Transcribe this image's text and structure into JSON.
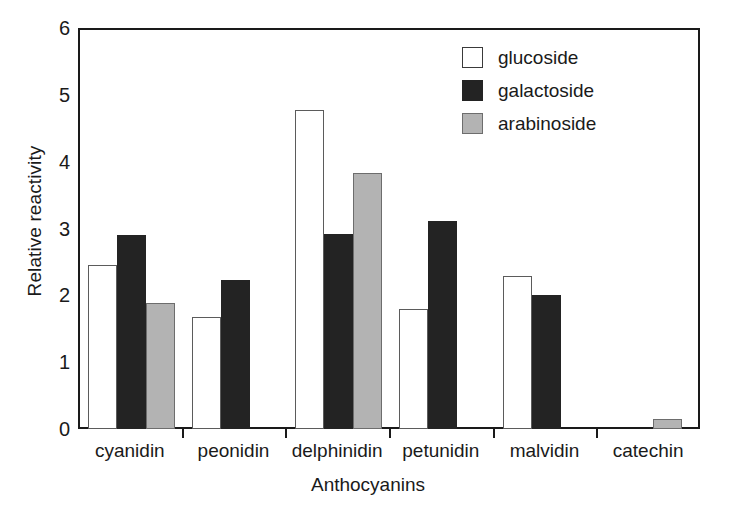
{
  "chart_data": {
    "type": "bar",
    "title": "",
    "xlabel": "Anthocyanins",
    "ylabel": "Relative reactivity",
    "ylim": [
      0,
      6
    ],
    "ytick_labels": [
      "0",
      "1",
      "2",
      "3",
      "4",
      "5",
      "6"
    ],
    "yticks": [
      0,
      1,
      2,
      3,
      4,
      5,
      6
    ],
    "grid": false,
    "legend_position": "top-right",
    "categories": [
      "cyanidin",
      "peonidin",
      "delphinidin",
      "petunidin",
      "malvidin",
      "catechin"
    ],
    "series": [
      {
        "name": "glucoside",
        "color": "#ffffff",
        "values": [
          2.46,
          1.68,
          4.77,
          1.8,
          2.29,
          null
        ]
      },
      {
        "name": "galactoside",
        "color": "#232323",
        "values": [
          2.91,
          2.23,
          2.92,
          3.11,
          2.0,
          null
        ]
      },
      {
        "name": "arabinoside",
        "color": "#b3b3b3",
        "values": [
          1.88,
          null,
          3.83,
          null,
          null,
          0.15
        ]
      }
    ]
  },
  "legend": {
    "items": [
      {
        "label": "glucoside",
        "swatch": "glucoside"
      },
      {
        "label": "galactoside",
        "swatch": "galactoside"
      },
      {
        "label": "arabinoside",
        "swatch": "arabinoside"
      }
    ]
  },
  "axes": {
    "y_title": "Relative reactivity",
    "x_title": "Anthocyanins"
  },
  "colors": {
    "axis": "#1a1a1a",
    "glucoside": "#ffffff",
    "galactoside": "#232323",
    "arabinoside": "#b3b3b3",
    "background": "#ffffff"
  }
}
